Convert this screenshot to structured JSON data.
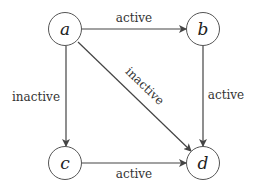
{
  "diagram": {
    "type": "directed-graph",
    "nodes": [
      {
        "id": "a",
        "label": "a"
      },
      {
        "id": "b",
        "label": "b"
      },
      {
        "id": "c",
        "label": "c"
      },
      {
        "id": "d",
        "label": "d"
      }
    ],
    "edges": [
      {
        "from": "a",
        "to": "b",
        "label": "active"
      },
      {
        "from": "a",
        "to": "c",
        "label": "inactive"
      },
      {
        "from": "a",
        "to": "d",
        "label": "inactive"
      },
      {
        "from": "b",
        "to": "d",
        "label": "active"
      },
      {
        "from": "c",
        "to": "d",
        "label": "active"
      }
    ],
    "colors": {
      "stroke": "#444444",
      "text": "#222222"
    }
  }
}
